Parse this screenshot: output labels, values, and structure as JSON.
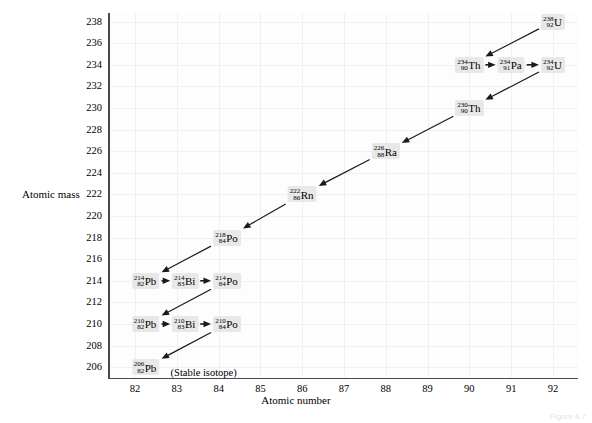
{
  "chart_data": {
    "type": "scatter",
    "title": "",
    "xlabel": "Atomic number",
    "ylabel": "Atomic mass",
    "xlim": [
      81.4,
      92.6
    ],
    "ylim": [
      205.0,
      238.8
    ],
    "xticks": [
      82,
      83,
      84,
      85,
      86,
      87,
      88,
      89,
      90,
      91,
      92
    ],
    "yticks": [
      206,
      208,
      210,
      212,
      214,
      216,
      218,
      220,
      222,
      224,
      226,
      228,
      230,
      232,
      234,
      236,
      238
    ],
    "grid": true,
    "legend": null,
    "nodes": [
      {
        "id": "U238",
        "mass": "238",
        "z": "92",
        "symbol": "U",
        "x": 92,
        "y": 238
      },
      {
        "id": "Th234",
        "mass": "234",
        "z": "90",
        "symbol": "Th",
        "x": 90,
        "y": 234
      },
      {
        "id": "Pa234",
        "mass": "234",
        "z": "91",
        "symbol": "Pa",
        "x": 91,
        "y": 234
      },
      {
        "id": "U234",
        "mass": "234",
        "z": "92",
        "symbol": "U",
        "x": 92,
        "y": 234
      },
      {
        "id": "Th230",
        "mass": "230",
        "z": "90",
        "symbol": "Th",
        "x": 90,
        "y": 230
      },
      {
        "id": "Ra226",
        "mass": "226",
        "z": "88",
        "symbol": "Ra",
        "x": 88,
        "y": 226
      },
      {
        "id": "Rn222",
        "mass": "222",
        "z": "86",
        "symbol": "Rn",
        "x": 86,
        "y": 222
      },
      {
        "id": "Po218",
        "mass": "218",
        "z": "84",
        "symbol": "Po",
        "x": 84.2,
        "y": 218
      },
      {
        "id": "Pb214",
        "mass": "214",
        "z": "82",
        "symbol": "Pb",
        "x": 82.25,
        "y": 214
      },
      {
        "id": "Bi214",
        "mass": "214",
        "z": "83",
        "symbol": "Bi",
        "x": 83.2,
        "y": 214
      },
      {
        "id": "Po214",
        "mass": "214",
        "z": "84",
        "symbol": "Po",
        "x": 84.2,
        "y": 214
      },
      {
        "id": "Pb210",
        "mass": "210",
        "z": "82",
        "symbol": "Pb",
        "x": 82.25,
        "y": 210
      },
      {
        "id": "Bi210",
        "mass": "210",
        "z": "83",
        "symbol": "Bi",
        "x": 83.2,
        "y": 210
      },
      {
        "id": "Po210",
        "mass": "210",
        "z": "84",
        "symbol": "Po",
        "x": 84.2,
        "y": 210
      },
      {
        "id": "Pb206",
        "mass": "206",
        "z": "82",
        "symbol": "Pb",
        "x": 82.25,
        "y": 206
      }
    ],
    "decays": [
      {
        "from": "U238",
        "to": "Th234",
        "type": "alpha"
      },
      {
        "from": "Th234",
        "to": "Pa234",
        "type": "beta"
      },
      {
        "from": "Pa234",
        "to": "U234",
        "type": "beta"
      },
      {
        "from": "U234",
        "to": "Th230",
        "type": "alpha"
      },
      {
        "from": "Th230",
        "to": "Ra226",
        "type": "alpha"
      },
      {
        "from": "Ra226",
        "to": "Rn222",
        "type": "alpha"
      },
      {
        "from": "Rn222",
        "to": "Po218",
        "type": "alpha"
      },
      {
        "from": "Po218",
        "to": "Pb214",
        "type": "alpha"
      },
      {
        "from": "Pb214",
        "to": "Bi214",
        "type": "beta"
      },
      {
        "from": "Bi214",
        "to": "Po214",
        "type": "beta"
      },
      {
        "from": "Po214",
        "to": "Pb210",
        "type": "alpha"
      },
      {
        "from": "Pb210",
        "to": "Bi210",
        "type": "beta"
      },
      {
        "from": "Bi210",
        "to": "Po210",
        "type": "beta"
      },
      {
        "from": "Po210",
        "to": "Pb206",
        "type": "alpha"
      }
    ],
    "annotations": [
      {
        "id": "stable-note",
        "text": "(Stable isotope)",
        "x": 82.85,
        "y": 205.55
      }
    ]
  },
  "caption": "Figure 4.7"
}
